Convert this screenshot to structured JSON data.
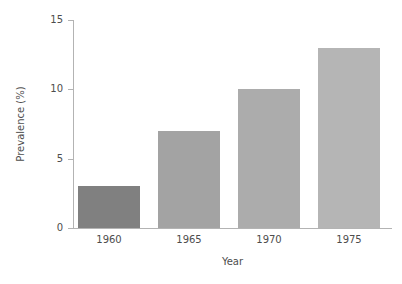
{
  "chart_data": {
    "type": "bar",
    "title": "",
    "categories": [
      "1960",
      "1965",
      "1970",
      "1975"
    ],
    "values": [
      3,
      7,
      10,
      13
    ],
    "series": [
      {
        "name": "Prevalence",
        "values": [
          3,
          7,
          10,
          13
        ]
      }
    ],
    "xlabel": "Year",
    "ylabel": "Prevalence (%)",
    "ylim": [
      0,
      15
    ],
    "yticks": [
      0,
      5,
      10,
      15
    ],
    "ytick_labels": [
      "0",
      "5",
      "10",
      "15"
    ],
    "grid": false,
    "legend": false,
    "bar_colors": [
      "#808080",
      "#a3a3a3",
      "#acacac",
      "#b5b5b5"
    ],
    "axis_color": "#b3b3b3",
    "text_color": "#4d4d4d",
    "background": "#ffffff"
  },
  "axes": {
    "y_title": "Prevalence (%)",
    "x_title": "Year",
    "y_tick_0": "0",
    "y_tick_1": "5",
    "y_tick_2": "10",
    "y_tick_3": "15",
    "x_tick_0": "1960",
    "x_tick_1": "1965",
    "x_tick_2": "1970",
    "x_tick_3": "1975"
  }
}
